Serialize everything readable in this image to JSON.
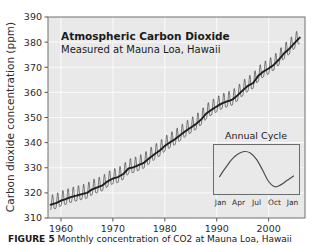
{
  "figure": {
    "caption_label": "FIGURE 5",
    "caption_text": "Monthly concentration of CO2 at Mauna Loa, Hawaii"
  },
  "chart_data": {
    "type": "line",
    "title": "Atmospheric Carbon Dioxide",
    "subtitle": "Measured at Mauna Loa, Hawaii",
    "xlabel": "",
    "ylabel": "Carbon dioxide concentration (ppm)",
    "xlim": [
      1957.5,
      2007.0
    ],
    "ylim": [
      310,
      390
    ],
    "xticks": [
      1960,
      1970,
      1980,
      1990,
      2000
    ],
    "xtick_labels": [
      "1960",
      "1970",
      "1980",
      "1990",
      "2000"
    ],
    "yticks": [
      310,
      320,
      330,
      340,
      350,
      360,
      370,
      380,
      390
    ],
    "ytick_labels": [
      "310",
      "320",
      "330",
      "340",
      "350",
      "360",
      "370",
      "380",
      "390"
    ],
    "grid": true,
    "legend": "none",
    "plot_bg_color": "#e9e9e9",
    "line_color": "#2a2a2a",
    "series": [
      {
        "name": "Annual mean CO2 (ppm)",
        "x": [
          1958,
          1959,
          1960,
          1961,
          1962,
          1963,
          1964,
          1965,
          1966,
          1967,
          1968,
          1969,
          1970,
          1971,
          1972,
          1973,
          1974,
          1975,
          1976,
          1977,
          1978,
          1979,
          1980,
          1981,
          1982,
          1983,
          1984,
          1985,
          1986,
          1987,
          1988,
          1989,
          1990,
          1991,
          1992,
          1993,
          1994,
          1995,
          1996,
          1997,
          1998,
          1999,
          2000,
          2001,
          2002,
          2003,
          2004,
          2005,
          2006
        ],
        "values": [
          315.3,
          315.9,
          316.9,
          317.6,
          318.4,
          318.9,
          319.5,
          320.0,
          321.4,
          322.2,
          323.0,
          324.6,
          325.7,
          326.3,
          327.5,
          329.7,
          330.2,
          331.1,
          332.0,
          333.8,
          335.4,
          336.8,
          338.7,
          340.1,
          341.4,
          343.0,
          344.6,
          346.0,
          347.4,
          349.2,
          351.6,
          353.1,
          354.4,
          355.6,
          356.4,
          357.1,
          358.8,
          360.8,
          362.6,
          363.7,
          366.6,
          368.3,
          369.5,
          371.0,
          373.1,
          375.6,
          377.4,
          379.7,
          381.8
        ]
      }
    ],
    "seasonal_amplitude_ppm": 6.0,
    "seasonal_peak_month": "May",
    "seasonal_min_month": "October"
  },
  "inset": {
    "title": "Annual Cycle",
    "xtick_labels": [
      "Jan",
      "Apr",
      "Jul",
      "Oct",
      "Jan"
    ],
    "curve_description": "Seasonal CO2 cycle: rises to May peak, falls to October minimum, rises again",
    "values": [
      0.3,
      0.55,
      0.78,
      0.93,
      1.0,
      0.96,
      0.78,
      0.48,
      0.16,
      0.02,
      0.08,
      0.2,
      0.32
    ],
    "border_color": "#6b6b6b",
    "line_color": "#4a4a4a"
  }
}
